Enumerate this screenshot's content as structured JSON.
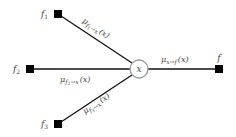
{
  "diagram": {
    "type": "factor-graph-messages",
    "variable_node": {
      "id": "x",
      "label": "x"
    },
    "factor_nodes": [
      {
        "id": "f1",
        "label": "f",
        "sub": "1"
      },
      {
        "id": "f2",
        "label": "f",
        "sub": "2"
      },
      {
        "id": "f3",
        "label": "f",
        "sub": "3"
      },
      {
        "id": "f",
        "label": "f",
        "sub": ""
      }
    ],
    "messages": [
      {
        "from": "f1",
        "to": "x",
        "mu": "μ",
        "sub_from": "f",
        "sub_from_idx": "1",
        "arrow": "→x",
        "arg": "(x)"
      },
      {
        "from": "f2",
        "to": "x",
        "mu": "μ",
        "sub_from": "f",
        "sub_from_idx": "2",
        "arrow": "→x",
        "arg": "(x)"
      },
      {
        "from": "f3",
        "to": "x",
        "mu": "μ",
        "sub_from": "f",
        "sub_from_idx": "3",
        "arrow": "→x",
        "arg": "(x)"
      },
      {
        "from": "x",
        "to": "f",
        "mu": "μ",
        "sub_from": "x",
        "sub_from_idx": "",
        "arrow": "→f",
        "arg": "(x)"
      }
    ]
  }
}
